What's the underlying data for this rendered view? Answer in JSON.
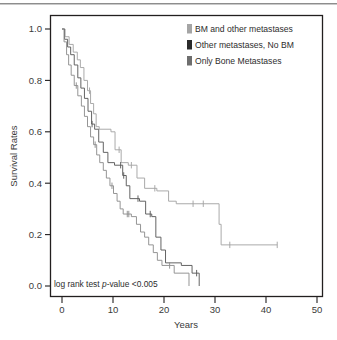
{
  "figure": {
    "background": "#ffffff",
    "frame_color": "#221f1f"
  },
  "chart_data": {
    "type": "line",
    "title": "",
    "subtitle": "",
    "xlabel": "Years",
    "ylabel": "Survival Rates",
    "xlim": [
      0,
      50
    ],
    "ylim": [
      0.0,
      1.0
    ],
    "xticks": [
      0,
      10,
      20,
      30,
      40,
      50
    ],
    "xticklabels": [
      "0",
      "10",
      "20",
      "30",
      "40",
      "50"
    ],
    "yticks": [
      0.0,
      0.2,
      0.4,
      0.6,
      0.8,
      1.0
    ],
    "yticklabels": [
      "0.0",
      "0.2",
      "0.4",
      "0.6",
      "0.8",
      "1.0"
    ],
    "grid": false,
    "legend_position": "top-right",
    "annotations": [
      {
        "name": "log-rank-annotation",
        "text_before": "log rank test ",
        "text_italic": "p",
        "text_after": "-value <0.005",
        "x": 0.6,
        "y": 0.028
      }
    ],
    "series": [
      {
        "name": "BM and other metastases",
        "color": "#a5a5a5",
        "legend_swatch": "#a5a5a5",
        "points": [
          [
            0.0,
            1.0
          ],
          [
            0.6,
            1.0
          ],
          [
            0.6,
            0.97
          ],
          [
            1.4,
            0.97
          ],
          [
            1.4,
            0.94
          ],
          [
            2.2,
            0.94
          ],
          [
            2.2,
            0.91
          ],
          [
            3.0,
            0.91
          ],
          [
            3.0,
            0.88
          ],
          [
            3.6,
            0.88
          ],
          [
            3.6,
            0.85
          ],
          [
            4.3,
            0.85
          ],
          [
            4.3,
            0.8
          ],
          [
            5.0,
            0.8
          ],
          [
            5.0,
            0.76
          ],
          [
            5.6,
            0.76
          ],
          [
            5.6,
            0.71
          ],
          [
            6.2,
            0.71
          ],
          [
            6.2,
            0.67
          ],
          [
            6.7,
            0.67
          ],
          [
            6.7,
            0.62
          ],
          [
            7.3,
            0.62
          ],
          [
            7.3,
            0.61
          ],
          [
            9.6,
            0.61
          ],
          [
            9.6,
            0.6
          ],
          [
            10.4,
            0.6
          ],
          [
            10.4,
            0.53
          ],
          [
            11.6,
            0.53
          ],
          [
            11.6,
            0.48
          ],
          [
            13.0,
            0.48
          ],
          [
            13.0,
            0.47
          ],
          [
            14.7,
            0.47
          ],
          [
            14.7,
            0.42
          ],
          [
            16.2,
            0.42
          ],
          [
            16.2,
            0.38
          ],
          [
            18.6,
            0.38
          ],
          [
            18.6,
            0.37
          ],
          [
            20.9,
            0.37
          ],
          [
            20.9,
            0.33
          ],
          [
            22.4,
            0.33
          ],
          [
            22.4,
            0.32
          ],
          [
            30.8,
            0.32
          ],
          [
            30.8,
            0.24
          ],
          [
            31.2,
            0.24
          ],
          [
            31.2,
            0.16
          ],
          [
            42.2,
            0.16
          ]
        ],
        "censored": [
          [
            5.4,
            0.76
          ],
          [
            11.2,
            0.53
          ],
          [
            13.6,
            0.47
          ],
          [
            18.2,
            0.38
          ],
          [
            25.7,
            0.32
          ],
          [
            27.7,
            0.32
          ],
          [
            32.9,
            0.16
          ],
          [
            42.2,
            0.16
          ]
        ]
      },
      {
        "name": "Other metastases, No BM",
        "color": "#5c5c5c",
        "legend_swatch": "#2b2b2b",
        "points": [
          [
            0.0,
            1.0
          ],
          [
            0.5,
            1.0
          ],
          [
            0.5,
            0.96
          ],
          [
            1.1,
            0.96
          ],
          [
            1.1,
            0.93
          ],
          [
            1.7,
            0.93
          ],
          [
            1.7,
            0.9
          ],
          [
            2.4,
            0.9
          ],
          [
            2.4,
            0.86
          ],
          [
            3.1,
            0.86
          ],
          [
            3.1,
            0.81
          ],
          [
            3.7,
            0.81
          ],
          [
            3.7,
            0.77
          ],
          [
            4.4,
            0.77
          ],
          [
            4.4,
            0.73
          ],
          [
            5.1,
            0.73
          ],
          [
            5.1,
            0.68
          ],
          [
            5.8,
            0.68
          ],
          [
            5.8,
            0.63
          ],
          [
            6.4,
            0.63
          ],
          [
            6.4,
            0.61
          ],
          [
            7.2,
            0.61
          ],
          [
            7.2,
            0.56
          ],
          [
            8.1,
            0.56
          ],
          [
            8.1,
            0.52
          ],
          [
            9.0,
            0.52
          ],
          [
            9.0,
            0.48
          ],
          [
            10.3,
            0.48
          ],
          [
            10.3,
            0.47
          ],
          [
            11.9,
            0.47
          ],
          [
            11.9,
            0.43
          ],
          [
            12.6,
            0.43
          ],
          [
            12.6,
            0.39
          ],
          [
            13.3,
            0.39
          ],
          [
            13.3,
            0.34
          ],
          [
            15.2,
            0.34
          ],
          [
            15.2,
            0.33
          ],
          [
            16.4,
            0.33
          ],
          [
            16.4,
            0.28
          ],
          [
            17.6,
            0.28
          ],
          [
            17.6,
            0.27
          ],
          [
            18.4,
            0.27
          ],
          [
            18.4,
            0.19
          ],
          [
            19.4,
            0.19
          ],
          [
            19.4,
            0.14
          ],
          [
            20.3,
            0.14
          ],
          [
            20.3,
            0.09
          ],
          [
            23.4,
            0.09
          ],
          [
            23.4,
            0.08
          ],
          [
            25.5,
            0.08
          ],
          [
            25.5,
            0.05
          ],
          [
            26.9,
            0.05
          ],
          [
            26.9,
            0.0
          ]
        ],
        "censored": [
          [
            5.9,
            0.63
          ],
          [
            11.5,
            0.47
          ],
          [
            12.1,
            0.43
          ],
          [
            14.9,
            0.34
          ],
          [
            17.3,
            0.28
          ],
          [
            26.4,
            0.05
          ]
        ]
      },
      {
        "name": "Only Bone Metastases",
        "color": "#8f8f8f",
        "legend_swatch": "#6e6e6e",
        "points": [
          [
            0.0,
            1.0
          ],
          [
            0.4,
            1.0
          ],
          [
            0.4,
            0.95
          ],
          [
            0.9,
            0.95
          ],
          [
            0.9,
            0.9
          ],
          [
            1.3,
            0.9
          ],
          [
            1.3,
            0.86
          ],
          [
            1.8,
            0.86
          ],
          [
            1.8,
            0.82
          ],
          [
            2.4,
            0.82
          ],
          [
            2.4,
            0.78
          ],
          [
            3.1,
            0.78
          ],
          [
            3.1,
            0.74
          ],
          [
            3.8,
            0.74
          ],
          [
            3.8,
            0.7
          ],
          [
            4.4,
            0.7
          ],
          [
            4.4,
            0.66
          ],
          [
            5.0,
            0.66
          ],
          [
            5.0,
            0.62
          ],
          [
            5.6,
            0.62
          ],
          [
            5.6,
            0.58
          ],
          [
            6.2,
            0.58
          ],
          [
            6.2,
            0.55
          ],
          [
            6.8,
            0.55
          ],
          [
            6.8,
            0.51
          ],
          [
            7.4,
            0.51
          ],
          [
            7.4,
            0.48
          ],
          [
            8.1,
            0.48
          ],
          [
            8.1,
            0.45
          ],
          [
            8.7,
            0.45
          ],
          [
            8.7,
            0.42
          ],
          [
            9.4,
            0.42
          ],
          [
            9.4,
            0.39
          ],
          [
            10.1,
            0.39
          ],
          [
            10.1,
            0.36
          ],
          [
            10.8,
            0.36
          ],
          [
            10.8,
            0.33
          ],
          [
            11.4,
            0.33
          ],
          [
            11.4,
            0.3
          ],
          [
            12.0,
            0.3
          ],
          [
            12.0,
            0.28
          ],
          [
            13.6,
            0.28
          ],
          [
            13.6,
            0.27
          ],
          [
            14.6,
            0.27
          ],
          [
            14.6,
            0.24
          ],
          [
            15.4,
            0.24
          ],
          [
            15.4,
            0.21
          ],
          [
            16.2,
            0.21
          ],
          [
            16.2,
            0.19
          ],
          [
            17.0,
            0.19
          ],
          [
            17.0,
            0.16
          ],
          [
            17.9,
            0.16
          ],
          [
            17.9,
            0.13
          ],
          [
            18.7,
            0.13
          ],
          [
            18.7,
            0.1
          ],
          [
            19.6,
            0.1
          ],
          [
            19.6,
            0.08
          ],
          [
            22.0,
            0.08
          ],
          [
            22.0,
            0.05
          ],
          [
            24.9,
            0.05
          ],
          [
            24.9,
            0.0
          ]
        ],
        "censored": [
          [
            2.8,
            0.78
          ],
          [
            6.5,
            0.55
          ],
          [
            9.8,
            0.39
          ],
          [
            12.8,
            0.28
          ],
          [
            13.1,
            0.28
          ],
          [
            21.1,
            0.08
          ]
        ]
      }
    ],
    "legend": [
      {
        "label": "BM and other metastases",
        "color": "#a5a5a5"
      },
      {
        "label": "Other metastases, No BM",
        "color": "#2b2b2b"
      },
      {
        "label": "Only Bone Metastases",
        "color": "#6e6e6e"
      }
    ]
  }
}
